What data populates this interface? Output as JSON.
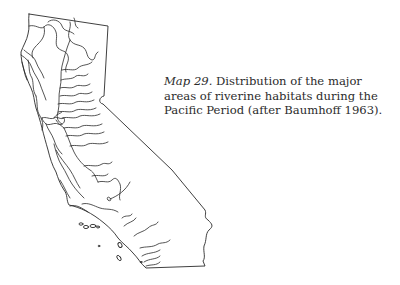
{
  "figure": {
    "map_label": "Map 29.",
    "caption_text": " Distribution of the major areas of riverine habitats during the Pacific Period (after Baumhoff 1963).",
    "region_depicted": "California",
    "features": [
      "state outline",
      "major river systems",
      "San Francisco Bay",
      "Lake Tahoe",
      "Channel Islands"
    ],
    "line_color": "#2a2a2a",
    "background_color": "#ffffff"
  }
}
